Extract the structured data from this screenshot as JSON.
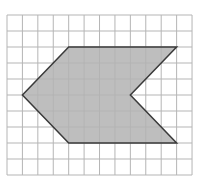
{
  "diagram": {
    "type": "grid-polygon",
    "grid": {
      "columns": 12,
      "rows": 10,
      "origin_x": 7,
      "origin_y": 15,
      "cell_w": 15.42,
      "cell_h": 16,
      "line_color": "#b5b5b5"
    },
    "polygon": {
      "vertices": [
        [
          4,
          2
        ],
        [
          11,
          2
        ],
        [
          8,
          5
        ],
        [
          11,
          8
        ],
        [
          4,
          8
        ],
        [
          1,
          5
        ]
      ],
      "fill": "#b3b3b3",
      "stroke": "#3a3a3a"
    }
  }
}
